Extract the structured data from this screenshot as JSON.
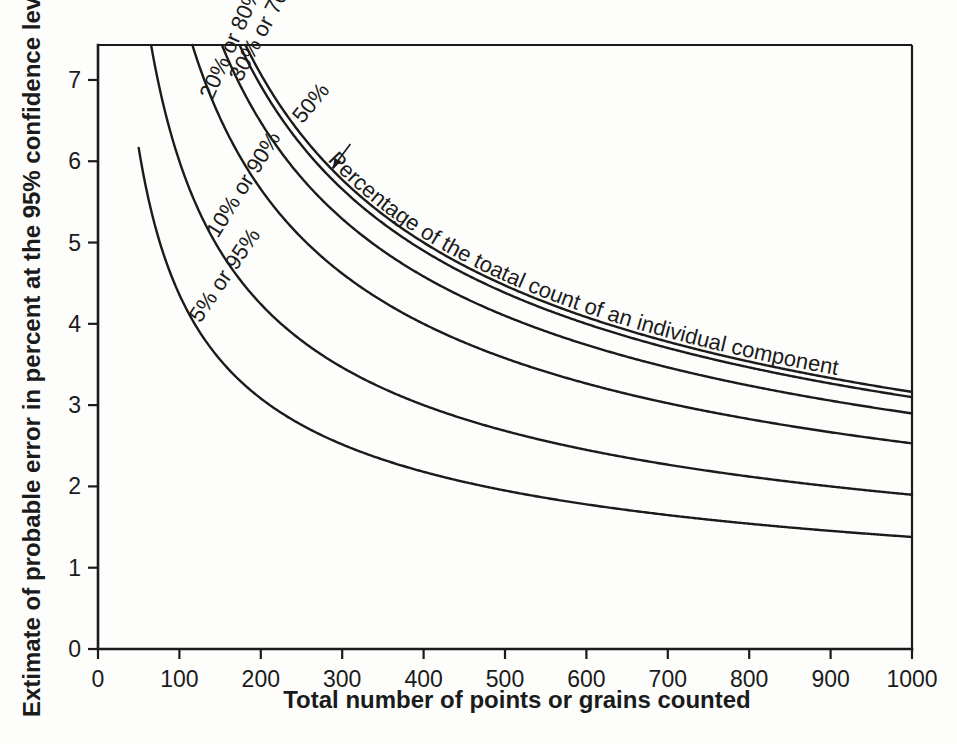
{
  "chart_data": {
    "type": "line",
    "title": "",
    "xlabel": "Total number of points or grains counted",
    "ylabel": "Extimate of probable error in percent at the 95% confidence level",
    "xlim": [
      0,
      1000
    ],
    "ylim": [
      0,
      7.43
    ],
    "xticks": [
      0,
      100,
      200,
      300,
      400,
      500,
      600,
      700,
      800,
      900,
      1000
    ],
    "yticks": [
      0,
      1,
      2,
      3,
      4,
      5,
      6,
      7
    ],
    "grid": false,
    "legend_position": "inline-curve-labels",
    "annotation": "Percentage of the toatal count of an individual component",
    "formula_note": "error = 2 * sqrt(p*(1-p)/n) * 100",
    "x": [
      50,
      60,
      70,
      80,
      90,
      100,
      120,
      140,
      160,
      180,
      200,
      250,
      300,
      350,
      400,
      450,
      500,
      550,
      600,
      650,
      700,
      750,
      800,
      850,
      900,
      950,
      1000
    ],
    "series": [
      {
        "name": "50%",
        "label": "50%",
        "p": 0.5,
        "values": [
          14.14,
          12.91,
          11.95,
          11.18,
          10.54,
          10.0,
          9.13,
          8.45,
          7.91,
          7.45,
          7.07,
          6.32,
          5.77,
          5.35,
          5.0,
          4.71,
          4.47,
          4.26,
          4.08,
          3.92,
          3.78,
          3.65,
          3.54,
          3.43,
          3.33,
          3.24,
          3.16
        ]
      },
      {
        "name": "40% or 60%",
        "label": "",
        "p": 0.4,
        "values": [
          13.86,
          12.65,
          11.71,
          10.95,
          10.33,
          9.8,
          8.94,
          8.28,
          7.75,
          7.3,
          6.93,
          6.2,
          5.66,
          5.24,
          4.9,
          4.62,
          4.38,
          4.18,
          4.0,
          3.84,
          3.7,
          3.58,
          3.46,
          3.36,
          3.27,
          3.18,
          3.1
        ]
      },
      {
        "name": "30% or 70%",
        "label": "30% or 70%",
        "p": 0.3,
        "values": [
          12.96,
          11.83,
          10.95,
          10.25,
          9.66,
          9.17,
          8.37,
          7.75,
          7.25,
          6.83,
          6.48,
          5.8,
          5.29,
          4.9,
          4.58,
          4.32,
          4.1,
          3.91,
          3.74,
          3.59,
          3.46,
          3.35,
          3.24,
          3.14,
          3.06,
          2.97,
          2.9
        ]
      },
      {
        "name": "20% or 80%",
        "label": "20% or 80%",
        "p": 0.2,
        "values": [
          11.31,
          10.33,
          9.56,
          8.94,
          8.43,
          8.0,
          7.3,
          6.76,
          6.32,
          5.96,
          5.66,
          5.06,
          4.62,
          4.28,
          4.0,
          3.77,
          3.58,
          3.41,
          3.27,
          3.14,
          3.02,
          2.92,
          2.83,
          2.74,
          2.67,
          2.6,
          2.53
        ]
      },
      {
        "name": "10% or 90%",
        "label": "10% or 90%",
        "p": 0.1,
        "values": [
          8.49,
          7.75,
          7.17,
          6.71,
          6.32,
          6.0,
          5.48,
          5.07,
          4.74,
          4.47,
          4.24,
          3.79,
          3.46,
          3.21,
          3.0,
          2.83,
          2.68,
          2.56,
          2.45,
          2.35,
          2.27,
          2.19,
          2.12,
          2.06,
          2.0,
          1.95,
          1.9
        ]
      },
      {
        "name": "5% or 95%",
        "label": "5% or 95%",
        "p": 0.05,
        "values": [
          6.16,
          5.63,
          5.21,
          4.87,
          4.59,
          4.36,
          3.98,
          3.68,
          3.45,
          3.25,
          3.08,
          2.76,
          2.52,
          2.33,
          2.18,
          2.05,
          1.95,
          1.86,
          1.78,
          1.71,
          1.65,
          1.59,
          1.54,
          1.49,
          1.45,
          1.41,
          1.38
        ]
      }
    ]
  },
  "colors": {
    "ink": "#1b1b1b",
    "background": "#fdfdfc"
  }
}
